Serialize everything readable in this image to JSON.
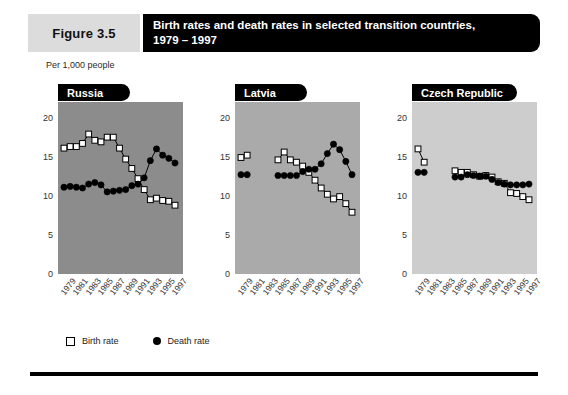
{
  "figure": {
    "tag": "Figure 3.5",
    "title_line1": "Birth rates and death rates in selected transition countries,",
    "title_line2": "1979 – 1997",
    "units": "Per 1,000 people"
  },
  "legend": {
    "birth_label": "Birth rate",
    "death_label": "Death rate",
    "birth_icon": "open-square-marker",
    "death_icon": "filled-circle-marker"
  },
  "colors": {
    "panel_russia_bg": "#8c8c8c",
    "panel_latvia_bg": "#aaaaaa",
    "panel_czech_bg": "#cdcdcd",
    "tag_bg": "#dcdcdc",
    "title_bg": "#000000",
    "marker_death": "#000000",
    "marker_birth": "#ffffff",
    "rule": "#000000"
  },
  "chart_data": {
    "type": "line",
    "title": "Birth rates and death rates in selected transition countries, 1979 – 1997",
    "xlabel": "",
    "ylabel": "Per 1,000 people",
    "ylim": [
      0,
      22
    ],
    "yticks": [
      0,
      5,
      10,
      15,
      20
    ],
    "grid": false,
    "legend_position": "bottom-left",
    "x": [
      1979,
      1980,
      1981,
      1982,
      1983,
      1984,
      1985,
      1986,
      1987,
      1988,
      1989,
      1990,
      1991,
      1992,
      1993,
      1994,
      1995,
      1996,
      1997
    ],
    "xtick_labels": [
      "1979",
      "1981",
      "1983",
      "1985",
      "1987",
      "1989",
      "1991",
      "1993",
      "1995",
      "1997"
    ],
    "panels": [
      {
        "name": "Russia",
        "bg": "#8c8c8c",
        "series": [
          {
            "name": "Birth rate",
            "marker": "open-square",
            "values": [
              16.1,
              16.3,
              16.3,
              16.7,
              17.9,
              17.1,
              16.9,
              17.5,
              17.5,
              16.1,
              14.7,
              13.5,
              12.2,
              10.8,
              9.5,
              9.7,
              9.4,
              9.3,
              8.8
            ]
          },
          {
            "name": "Death rate",
            "marker": "filled-circle",
            "values": [
              11.1,
              11.2,
              11.1,
              11.0,
              11.5,
              11.7,
              11.4,
              10.5,
              10.6,
              10.7,
              10.8,
              11.3,
              11.5,
              12.3,
              14.5,
              16.0,
              15.2,
              14.8,
              14.2
            ]
          }
        ]
      },
      {
        "name": "Latvia",
        "bg": "#aaaaaa",
        "series": [
          {
            "name": "Birth rate",
            "marker": "open-square",
            "values": [
              14.9,
              15.2,
              null,
              null,
              null,
              null,
              14.6,
              15.6,
              14.6,
              14.3,
              13.8,
              13.0,
              12.0,
              11.0,
              10.2,
              9.6,
              9.9,
              9.0,
              7.9
            ]
          },
          {
            "name": "Death rate",
            "marker": "filled-circle",
            "values": [
              12.7,
              12.7,
              null,
              null,
              null,
              null,
              12.6,
              12.6,
              12.6,
              12.6,
              13.1,
              13.4,
              13.4,
              14.1,
              15.4,
              16.6,
              15.9,
              14.4,
              12.7
            ]
          }
        ]
      },
      {
        "name": "Czech Republic",
        "bg": "#cdcdcd",
        "series": [
          {
            "name": "Birth rate",
            "marker": "open-square",
            "values": [
              16.0,
              14.3,
              null,
              null,
              null,
              null,
              13.2,
              13.0,
              13.0,
              12.7,
              12.5,
              12.6,
              12.4,
              11.8,
              11.6,
              10.4,
              10.3,
              9.9,
              9.5
            ]
          },
          {
            "name": "Death rate",
            "marker": "filled-circle",
            "values": [
              13.0,
              13.0,
              null,
              null,
              null,
              null,
              12.4,
              12.4,
              12.7,
              12.6,
              12.5,
              12.5,
              12.1,
              11.7,
              11.5,
              11.4,
              11.4,
              11.4,
              11.5
            ]
          }
        ]
      }
    ]
  }
}
